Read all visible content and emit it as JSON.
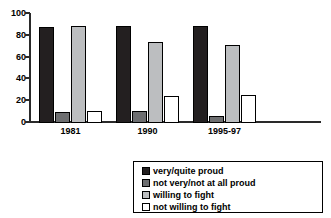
{
  "chart_data": {
    "type": "bar",
    "title": "",
    "xlabel": "",
    "ylabel": "",
    "ylim": [
      0,
      100
    ],
    "yticks": [
      0,
      20,
      40,
      60,
      80,
      100
    ],
    "grid": false,
    "legend_position": "bottom-right",
    "categories": [
      "1981",
      "1990",
      "1995-97"
    ],
    "series": [
      {
        "name": "very/quite proud",
        "color": "#231f20",
        "values": [
          88,
          89,
          89
        ]
      },
      {
        "name": "not very/not at all proud",
        "color": "#6d6e70",
        "values": [
          10,
          11,
          6
        ]
      },
      {
        "name": "willing to fight",
        "color": "#bcbec0",
        "values": [
          89,
          74,
          72
        ]
      },
      {
        "name": "not willing to fight",
        "color": "#ffffff",
        "values": [
          11,
          25,
          26
        ]
      }
    ]
  },
  "axis": {
    "y_tick_labels": [
      "100",
      "80",
      "60",
      "40",
      "20",
      "0"
    ]
  },
  "legend": {
    "items": [
      {
        "label": "very/quite proud"
      },
      {
        "label": "not very/not at all proud"
      },
      {
        "label": "willing to fight"
      },
      {
        "label": "not willing to fight"
      }
    ]
  }
}
